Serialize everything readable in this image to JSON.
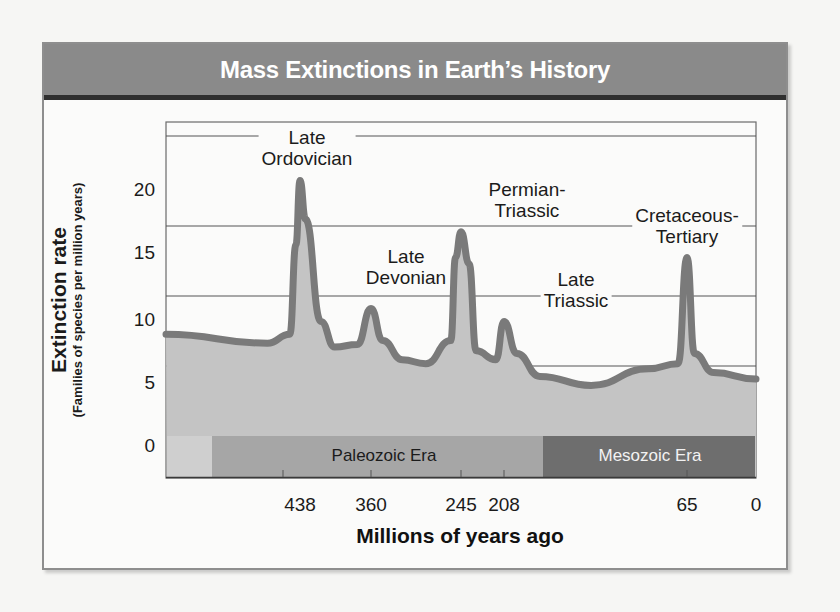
{
  "figure": {
    "title": "Mass Extinctions in Earth’s History",
    "colors": {
      "title_bar": "#8a8a8a",
      "title_bar_bottom": "#2f2f2f",
      "area_fill": "#c4c4c4",
      "line": "#7a7a7a",
      "paleozoic_band": "#a6a6a6",
      "mesozoic_band": "#6e6e6e",
      "early_band": "#cfcfcf"
    }
  },
  "chart_data": {
    "type": "area",
    "title": "Mass Extinctions in Earth’s History",
    "ylabel": "Extinction rate",
    "ylabel_sub": "(Families of species per million years)",
    "xlabel": "Millions of years ago",
    "yticks": [
      0,
      5,
      10,
      15,
      20
    ],
    "ylim": [
      0,
      23
    ],
    "xticks": [
      438,
      360,
      245,
      208,
      65,
      0
    ],
    "x_reversed": true,
    "grid": "horizontal",
    "series": [
      {
        "name": "Extinction rate",
        "points": [
          {
            "x": 570,
            "y": 8.5
          },
          {
            "x": 470,
            "y": 7.8
          },
          {
            "x": 448,
            "y": 8.5
          },
          {
            "x": 442,
            "y": 15.5
          },
          {
            "x": 438,
            "y": 20.5
          },
          {
            "x": 432,
            "y": 17.5
          },
          {
            "x": 415,
            "y": 9.5
          },
          {
            "x": 400,
            "y": 7.5
          },
          {
            "x": 375,
            "y": 7.7
          },
          {
            "x": 360,
            "y": 10.5
          },
          {
            "x": 345,
            "y": 8.0
          },
          {
            "x": 320,
            "y": 6.5
          },
          {
            "x": 290,
            "y": 6.2
          },
          {
            "x": 258,
            "y": 8.0
          },
          {
            "x": 252,
            "y": 14.5
          },
          {
            "x": 245,
            "y": 16.5
          },
          {
            "x": 238,
            "y": 14.0
          },
          {
            "x": 232,
            "y": 7.2
          },
          {
            "x": 215,
            "y": 6.5
          },
          {
            "x": 208,
            "y": 9.5
          },
          {
            "x": 198,
            "y": 7.0
          },
          {
            "x": 180,
            "y": 5.2
          },
          {
            "x": 140,
            "y": 4.5
          },
          {
            "x": 95,
            "y": 5.8
          },
          {
            "x": 72,
            "y": 6.2
          },
          {
            "x": 65,
            "y": 14.5
          },
          {
            "x": 58,
            "y": 7.0
          },
          {
            "x": 40,
            "y": 5.5
          },
          {
            "x": 0,
            "y": 5.0
          }
        ]
      }
    ],
    "annotations": [
      {
        "label": "Late Ordovician",
        "x": 438,
        "y": 20.5
      },
      {
        "label": "Late Devonian",
        "x": 360,
        "y": 10.5
      },
      {
        "label": "Permian-Triassic",
        "x": 245,
        "y": 16.5
      },
      {
        "label": "Late Triassic",
        "x": 208,
        "y": 9.5
      },
      {
        "label": "Cretaceous-Tertiary",
        "x": 65,
        "y": 14.5
      }
    ],
    "eras": [
      {
        "name": "Paleozoic Era",
        "from": 541,
        "to": 251
      },
      {
        "name": "Mesozoic Era",
        "from": 251,
        "to": 0
      }
    ]
  },
  "axis": {
    "y_title": "Extinction rate",
    "y_subtitle": "(Families of species per million years)",
    "x_title": "Millions of years ago",
    "y_ticks": [
      "20",
      "15",
      "10",
      "5",
      "0"
    ],
    "x_ticks": [
      "438",
      "360",
      "245",
      "208",
      "65",
      "0"
    ]
  },
  "labels": {
    "ordovician_1": "Late",
    "ordovician_2": "Ordovician",
    "devonian_1": "Late",
    "devonian_2": "Devonian",
    "permian_1": "Permian-",
    "permian_2": "Triassic",
    "triassic_1": "Late",
    "triassic_2": "Triassic",
    "cretaceous_1": "Cretaceous-",
    "cretaceous_2": "Tertiary",
    "paleozoic": "Paleozoic Era",
    "mesozoic": "Mesozoic Era"
  }
}
